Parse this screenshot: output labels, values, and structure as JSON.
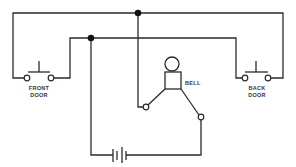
{
  "diagram": {
    "type": "circuit schematic",
    "title": "",
    "labels": {
      "front_door_line1": "FRONT",
      "front_door_line2": "DOOR",
      "back_door_line1": "BACK",
      "back_door_line2": "DOOR",
      "bell": "BELL"
    },
    "components": [
      {
        "id": "front-door-switch",
        "kind": "push-button switch",
        "label": "FRONT DOOR"
      },
      {
        "id": "back-door-switch",
        "kind": "push-button switch",
        "label": "BACK DOOR"
      },
      {
        "id": "bell",
        "kind": "bell",
        "label": "BELL"
      },
      {
        "id": "battery",
        "kind": "battery"
      }
    ],
    "junctions": 2,
    "colors": {
      "line": "#2b2b2b",
      "background": "#ffffff",
      "junction": "#111111"
    }
  }
}
